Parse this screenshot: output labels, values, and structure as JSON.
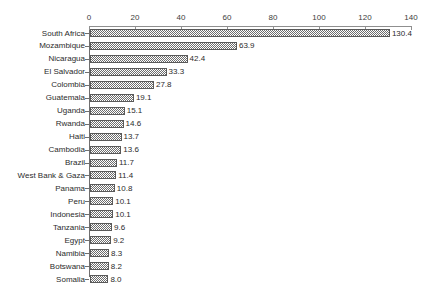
{
  "chart_data": {
    "type": "bar",
    "orientation": "horizontal",
    "title": "",
    "subtitle": "",
    "xlabel": "",
    "ylabel": "",
    "xlim": [
      0,
      140
    ],
    "xticks": [
      0,
      20,
      40,
      60,
      80,
      100,
      120,
      140
    ],
    "xtick_labels": [
      "0",
      "20",
      "40",
      "60",
      "80",
      "100",
      "120",
      "140"
    ],
    "grid": false,
    "legend": null,
    "axis_position": "top",
    "value_labels": true,
    "categories": [
      "South Africa",
      "Mozambique",
      "Nicaragua",
      "El Salvador",
      "Colombia",
      "Guatemala",
      "Uganda",
      "Rwanda",
      "Haiti",
      "Cambodia",
      "Brazil",
      "West Bank & Gaza",
      "Panama",
      "Peru",
      "Indonesia",
      "Tanzania",
      "Egypt",
      "Namibia",
      "Botswana",
      "Somalia"
    ],
    "values": [
      130.4,
      63.9,
      42.4,
      33.3,
      27.8,
      19.1,
      15.1,
      14.6,
      13.7,
      13.6,
      11.7,
      11.4,
      10.8,
      10.1,
      10.1,
      9.6,
      9.2,
      8.3,
      8.2,
      8.0
    ],
    "value_label_texts": [
      "130.4",
      "63.9",
      "42.4",
      "33.3",
      "27.8",
      "19.1",
      "15.1",
      "14.6",
      "13.7",
      "13.6",
      "11.7",
      "11.4",
      "10.8",
      "10.1",
      "10.1",
      "9.6",
      "9.2",
      "8.3",
      "8.2",
      "8.0"
    ],
    "colors": {
      "bar_fill": "#6e6e6e",
      "bar_edge": "#5a5a5a",
      "axis": "#8f8f8f",
      "text": "#2b2b2b",
      "background": "#ffffff"
    }
  }
}
